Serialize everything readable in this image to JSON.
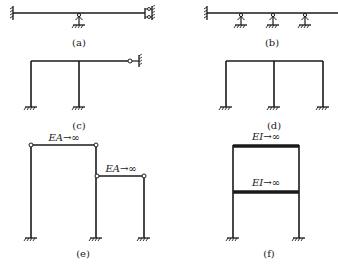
{
  "figure": {
    "colors": {
      "line": "#1a1a1a",
      "background": "#ffffff"
    },
    "panels": [
      {
        "id": "a",
        "label": "(a)",
        "description": "Continuous beam: fixed left end, intermediate pin support, guided (sliding) support at right end"
      },
      {
        "id": "b",
        "label": "(b)",
        "description": "Beam fixed at left with three intermediate pin supports, right end free"
      },
      {
        "id": "c",
        "label": "(c)",
        "description": "Portal frame with two fixed columns and a cantilevered beam ending in a hinged connection to a support"
      },
      {
        "id": "d",
        "label": "(d)",
        "description": "Two-bay portal frame with three fixed columns"
      },
      {
        "id": "e",
        "label": "(e)",
        "description": "Bent frame with rigid links",
        "annotations": [
          "EA→∞",
          "EA→∞"
        ]
      },
      {
        "id": "f",
        "label": "(f)",
        "description": "Two-storey frame with rigid beams",
        "annotations": [
          "EI→∞",
          "EI→∞"
        ]
      }
    ]
  }
}
